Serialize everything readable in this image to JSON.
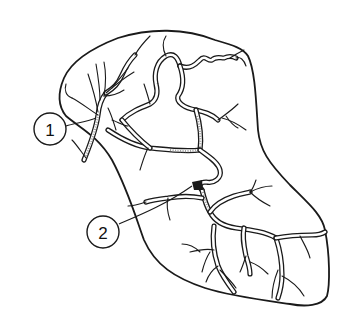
{
  "figure": {
    "colors": {
      "stroke": "#1a1a1a",
      "background": "#ffffff"
    },
    "labels": [
      {
        "id": "1",
        "text": "1",
        "cx": 50,
        "cy": 129,
        "r": 16
      },
      {
        "id": "2",
        "text": "2",
        "cx": 103,
        "cy": 232,
        "r": 16
      }
    ]
  }
}
